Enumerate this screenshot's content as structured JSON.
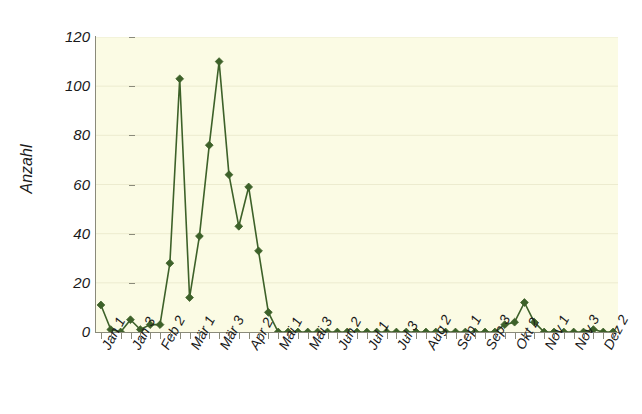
{
  "chart_data": {
    "type": "line",
    "title": "",
    "subtitle": "",
    "xlabel": "",
    "ylabel": "Anzahl",
    "ylim": [
      0,
      120
    ],
    "y_ticks": [
      0,
      20,
      40,
      60,
      80,
      100,
      120
    ],
    "grid": true,
    "grid_axis": "y",
    "legend": "none",
    "marker": "diamond",
    "series_color": "#3d6129",
    "plot_background": "#fbfbe4",
    "page_background": "#ffffff",
    "axis_color": "#8a8a7a",
    "x_tick_labels": [
      "Jan 1",
      "Jan 3",
      "Feb 2",
      "Mär 1",
      "Mär 3",
      "Apr 2",
      "Mai 1",
      "Mai 3",
      "Jun 2",
      "Jul 1",
      "Jul 3",
      "Aug 2",
      "Sep 1",
      "Sep 3",
      "Okt 2",
      "Nov 1",
      "Nov 3",
      "Dez 2"
    ],
    "x_tick_label_interval": 3,
    "x_count": 53,
    "x": [
      1,
      2,
      3,
      4,
      5,
      6,
      7,
      8,
      9,
      10,
      11,
      12,
      13,
      14,
      15,
      16,
      17,
      18,
      19,
      20,
      21,
      22,
      23,
      24,
      25,
      26,
      27,
      28,
      29,
      30,
      31,
      32,
      33,
      34,
      35,
      36,
      37,
      38,
      39,
      40,
      41,
      42,
      43,
      44,
      45,
      46,
      47,
      48,
      49,
      50,
      51,
      52,
      53
    ],
    "values": [
      11,
      1,
      0,
      5,
      1,
      3,
      3,
      28,
      103,
      14,
      39,
      76,
      110,
      64,
      43,
      59,
      33,
      8,
      0,
      0,
      0,
      0,
      0,
      0,
      0,
      0,
      0,
      0,
      0,
      0,
      0,
      0,
      0,
      0,
      0,
      0,
      0,
      0,
      0,
      0,
      0,
      3,
      4,
      12,
      4,
      0,
      0,
      0,
      0,
      0,
      1,
      0,
      0
    ],
    "annotations": [],
    "peaks": [
      {
        "label": "first peak",
        "value": 103
      },
      {
        "label": "second peak",
        "value": 110
      },
      {
        "label": "third peak",
        "value": 59
      },
      {
        "label": "autumn bump",
        "value": 12
      }
    ]
  }
}
